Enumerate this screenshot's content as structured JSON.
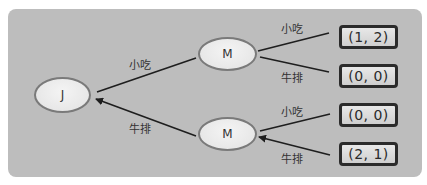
{
  "diagram": {
    "type": "game-tree",
    "nodes": {
      "root": {
        "label": "J"
      },
      "m_top": {
        "label": "M"
      },
      "m_bottom": {
        "label": "M"
      }
    },
    "edges": {
      "j_to_mtop": {
        "label": "小吃"
      },
      "j_to_mbottom": {
        "label": "牛排",
        "arrow": true
      },
      "mtop_to_p1": {
        "label": "小吃"
      },
      "mtop_to_p2": {
        "label": "牛排"
      },
      "mbottom_to_p3": {
        "label": "小吃"
      },
      "mbottom_to_p4": {
        "label": "牛排",
        "arrow": true
      }
    },
    "payoffs": [
      {
        "label": "(1, 2)"
      },
      {
        "label": "(0, 0)"
      },
      {
        "label": "(0, 0)"
      },
      {
        "label": "(2, 1)"
      }
    ],
    "colors": {
      "panel": "#bdbdbd",
      "node_fill": "#e8e8e8",
      "node_border": "#7a7a7a",
      "edge": "#1e1e1e",
      "payoff_border": "#2b2b2b"
    }
  }
}
